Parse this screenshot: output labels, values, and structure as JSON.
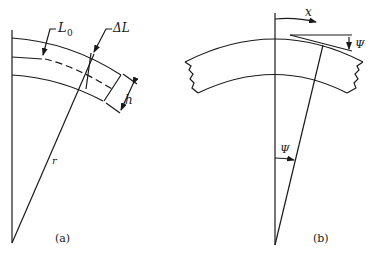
{
  "diagram": {
    "type": "beam-bending-geometry",
    "panel_a": {
      "caption": "(a)",
      "labels": {
        "original_length": "L",
        "original_length_subscript": "0",
        "elongation": "ΔL",
        "thickness": "h",
        "radius": "r"
      }
    },
    "panel_b": {
      "caption": "(b)",
      "labels": {
        "position": "x",
        "slope_angle_top": "Ψ",
        "slope_angle_center": "Ψ"
      }
    },
    "colors": {
      "stroke": "#1a1a1a",
      "background": "#ffffff"
    }
  }
}
